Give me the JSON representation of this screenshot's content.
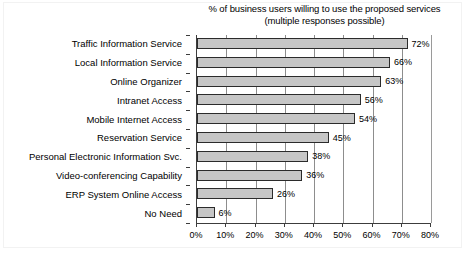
{
  "chart_data": {
    "type": "bar",
    "orientation": "horizontal",
    "title": "% of business users willing to use the proposed services (multiple responses possible)",
    "title_lines": [
      "% of business users willing to use the proposed services",
      "(multiple responses possible)"
    ],
    "xlabel": "",
    "ylabel": "",
    "xlim": [
      0,
      80
    ],
    "xtick_labels": [
      "0%",
      "10%",
      "20%",
      "30%",
      "40%",
      "50%",
      "60%",
      "70%",
      "80%"
    ],
    "xticks": [
      0,
      10,
      20,
      30,
      40,
      50,
      60,
      70,
      80
    ],
    "grid": "vertical",
    "legend": "none",
    "value_suffix": "%",
    "categories": [
      "Traffic Information Service",
      "Local Information Service",
      "Online Organizer",
      "Intranet Access",
      "Mobile Internet Access",
      "Reservation Service",
      "Personal Electronic Information Svc.",
      "Video-conferencing Capability",
      "ERP System Online Access",
      "No Need"
    ],
    "values": [
      72,
      66,
      63,
      56,
      54,
      45,
      38,
      36,
      26,
      6
    ],
    "value_labels": [
      "72%",
      "66%",
      "63%",
      "56%",
      "54%",
      "45%",
      "38%",
      "36%",
      "26%",
      "6%"
    ],
    "colors": {
      "bar_fill": "#c6c6c6",
      "bar_border": "#2b2b2b",
      "gridline": "#8d8d8d",
      "axis": "#3c3c3c",
      "text": "#000000",
      "background": "#ffffff"
    }
  }
}
